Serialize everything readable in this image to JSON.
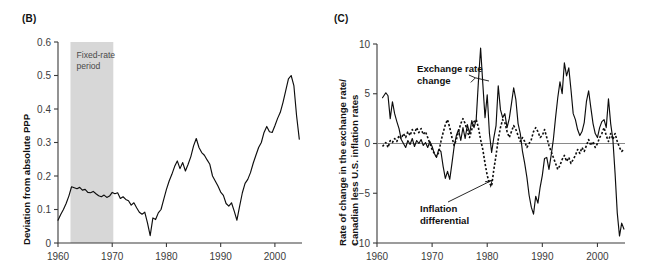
{
  "figure": {
    "panels": [
      {
        "id": "B",
        "label": "(B)",
        "shade_label_line1": "Fixed-rate",
        "shade_label_line2": "period"
      },
      {
        "id": "C",
        "label": "(C)",
        "annotation1_line1": "Exchange rate",
        "annotation1_line2": "change",
        "annotation2_line1": "Inflation",
        "annotation2_line2": "differential"
      }
    ]
  },
  "chart_data": [
    {
      "panel": "B",
      "type": "line",
      "title": "(B)",
      "xlabel": "",
      "ylabel": "Deviation from absolute PPP",
      "xlim": [
        1960,
        2005
      ],
      "ylim": [
        0,
        0.6
      ],
      "xticks": [
        1960,
        1970,
        1980,
        1990,
        2000
      ],
      "xtick_labels": [
        "1960",
        "1970",
        "1980",
        "1990",
        "2000"
      ],
      "yticks": [
        0,
        0.1,
        0.2,
        0.3,
        0.4,
        0.5,
        0.6
      ],
      "ytick_labels": [
        "0",
        "0.1",
        "0.2",
        "0.3",
        "0.4",
        "0.5",
        "0.6"
      ],
      "grid": false,
      "legend": "none",
      "annotations": [
        {
          "text": "Fixed-rate period",
          "type": "shaded-region-label",
          "x_range": [
            1962.3,
            1970.2
          ],
          "color": "#d7d7d7"
        }
      ],
      "series": [
        {
          "name": "Deviation from absolute PPP",
          "style": "solid",
          "x": [
            1960.0,
            1960.5,
            1961.0,
            1961.5,
            1962.0,
            1962.5,
            1963.0,
            1963.5,
            1964.0,
            1964.5,
            1965.0,
            1965.5,
            1966.0,
            1966.5,
            1967.0,
            1967.5,
            1968.0,
            1968.5,
            1969.0,
            1969.5,
            1970.0,
            1970.5,
            1971.0,
            1971.5,
            1972.0,
            1972.5,
            1973.0,
            1973.5,
            1974.0,
            1974.5,
            1975.0,
            1975.5,
            1976.0,
            1976.5,
            1977.0,
            1977.5,
            1978.0,
            1978.5,
            1979.0,
            1979.5,
            1980.0,
            1980.5,
            1981.0,
            1981.5,
            1982.0,
            1982.5,
            1983.0,
            1983.5,
            1984.0,
            1984.5,
            1985.0,
            1985.5,
            1986.0,
            1986.5,
            1987.0,
            1987.5,
            1988.0,
            1988.5,
            1989.0,
            1989.5,
            1990.0,
            1990.5,
            1991.0,
            1991.5,
            1992.0,
            1992.5,
            1993.0,
            1993.5,
            1994.0,
            1994.5,
            1995.0,
            1995.5,
            1996.0,
            1996.5,
            1997.0,
            1997.5,
            1998.0,
            1998.5,
            1999.0,
            1999.5,
            2000.0,
            2000.5,
            2001.0,
            2001.5,
            2002.0,
            2002.5,
            2003.0,
            2003.5,
            2004.0,
            2004.5
          ],
          "y": [
            0.068,
            0.085,
            0.1,
            0.118,
            0.14,
            0.168,
            0.165,
            0.162,
            0.166,
            0.158,
            0.16,
            0.151,
            0.15,
            0.154,
            0.147,
            0.141,
            0.138,
            0.143,
            0.136,
            0.14,
            0.151,
            0.147,
            0.15,
            0.133,
            0.138,
            0.13,
            0.126,
            0.113,
            0.12,
            0.105,
            0.092,
            0.086,
            0.092,
            0.06,
            0.022,
            0.075,
            0.07,
            0.09,
            0.1,
            0.13,
            0.16,
            0.185,
            0.205,
            0.228,
            0.245,
            0.222,
            0.24,
            0.215,
            0.235,
            0.258,
            0.29,
            0.312,
            0.285,
            0.27,
            0.262,
            0.248,
            0.235,
            0.2,
            0.185,
            0.17,
            0.152,
            0.142,
            0.118,
            0.11,
            0.12,
            0.095,
            0.068,
            0.11,
            0.15,
            0.178,
            0.19,
            0.21,
            0.238,
            0.262,
            0.285,
            0.3,
            0.33,
            0.348,
            0.332,
            0.33,
            0.35,
            0.372,
            0.39,
            0.42,
            0.455,
            0.49,
            0.5,
            0.47,
            0.38,
            0.31
          ],
          "units": "ratio"
        }
      ]
    },
    {
      "panel": "C",
      "type": "line",
      "title": "(C)",
      "xlabel": "",
      "ylabel": "Rate of change in the exchange rate/ Canadian less U.S. inflation rates",
      "ylabel_line1": "Rate of change in the exchange rate/",
      "ylabel_line2": "Canadian less U.S. inflation rates",
      "xlim": [
        1960,
        2005
      ],
      "ylim": [
        -10,
        10
      ],
      "xticks": [
        1960,
        1970,
        1980,
        1990,
        2000
      ],
      "xtick_labels": [
        "1960",
        "1970",
        "1980",
        "1990",
        "2000"
      ],
      "yticks": [
        -10,
        -5,
        0,
        5,
        10
      ],
      "ytick_labels": [
        "−10",
        "−5",
        "0",
        "5",
        "10"
      ],
      "grid": false,
      "legend": "annotations",
      "annotations": [
        {
          "text": "Exchange rate change",
          "points_to_series": "Exchange rate change",
          "at_x": 1978.5
        },
        {
          "text": "Inflation differential",
          "points_to_series": "Inflation differential",
          "at_x": 1980.5
        }
      ],
      "series": [
        {
          "name": "Exchange rate change",
          "style": "solid",
          "x": [
            1961.0,
            1961.6,
            1962.0,
            1962.4,
            1962.8,
            1963.2,
            1963.6,
            1964.0,
            1964.4,
            1964.8,
            1965.2,
            1965.6,
            1966.0,
            1966.4,
            1966.8,
            1967.2,
            1967.6,
            1968.0,
            1968.4,
            1968.8,
            1969.2,
            1969.6,
            1970.0,
            1970.4,
            1970.8,
            1971.2,
            1971.6,
            1972.0,
            1972.4,
            1972.8,
            1973.2,
            1973.6,
            1974.0,
            1974.4,
            1974.8,
            1975.2,
            1975.6,
            1976.0,
            1976.4,
            1976.8,
            1977.2,
            1977.6,
            1978.0,
            1978.4,
            1978.8,
            1979.2,
            1979.6,
            1980.0,
            1980.4,
            1980.8,
            1981.2,
            1981.6,
            1982.0,
            1982.4,
            1982.8,
            1983.2,
            1983.6,
            1984.0,
            1984.4,
            1984.8,
            1985.2,
            1985.6,
            1986.0,
            1986.4,
            1986.8,
            1987.2,
            1987.6,
            1988.0,
            1988.4,
            1988.8,
            1989.2,
            1989.6,
            1990.0,
            1990.4,
            1990.8,
            1991.2,
            1991.6,
            1992.0,
            1992.4,
            1992.8,
            1993.2,
            1993.6,
            1994.0,
            1994.4,
            1994.8,
            1995.2,
            1995.6,
            1996.0,
            1996.4,
            1996.8,
            1997.2,
            1997.6,
            1998.0,
            1998.4,
            1998.8,
            1999.2,
            1999.6,
            2000.0,
            2000.4,
            2000.8,
            2001.2,
            2001.6,
            2002.0,
            2002.4,
            2002.8,
            2003.2,
            2003.6,
            2004.0,
            2004.4,
            2004.8
          ],
          "y": [
            4.6,
            5.1,
            4.8,
            2.5,
            4.2,
            3.0,
            2.2,
            1.5,
            0.4,
            0.0,
            -0.4,
            0.3,
            -0.1,
            0.5,
            -0.3,
            0.3,
            0.0,
            0.4,
            -0.2,
            0.1,
            -0.4,
            0.2,
            -0.3,
            -1.0,
            -1.4,
            -0.6,
            -0.8,
            -2.3,
            -3.5,
            -2.8,
            -3.6,
            -2.0,
            -0.3,
            0.8,
            1.4,
            0.3,
            1.6,
            0.5,
            1.9,
            1.0,
            2.3,
            1.6,
            2.4,
            6.2,
            9.6,
            6.0,
            2.6,
            4.9,
            1.0,
            -0.9,
            0.6,
            1.8,
            5.8,
            3.4,
            2.6,
            3.0,
            1.6,
            2.5,
            4.0,
            5.6,
            4.4,
            2.0,
            1.0,
            -0.8,
            -2.0,
            -3.4,
            -5.2,
            -6.4,
            -7.1,
            -5.3,
            -6.0,
            -4.4,
            -3.2,
            -1.5,
            -1.4,
            -2.6,
            -1.2,
            0.4,
            2.6,
            4.6,
            6.2,
            5.0,
            8.1,
            6.8,
            7.6,
            5.4,
            3.0,
            2.4,
            1.4,
            0.8,
            1.2,
            2.1,
            4.2,
            5.3,
            3.6,
            2.0,
            1.0,
            0.6,
            1.6,
            2.2,
            2.4,
            1.6,
            4.5,
            2.0,
            0.4,
            -3.0,
            -7.0,
            -9.3,
            -8.0,
            -8.6
          ],
          "units": "percent"
        },
        {
          "name": "Inflation differential",
          "style": "dotted",
          "x": [
            1961.0,
            1961.6,
            1962.0,
            1962.4,
            1962.8,
            1963.2,
            1963.6,
            1964.0,
            1964.4,
            1964.8,
            1965.2,
            1965.6,
            1966.0,
            1966.4,
            1966.8,
            1967.2,
            1967.6,
            1968.0,
            1968.4,
            1968.8,
            1969.2,
            1969.6,
            1970.0,
            1970.4,
            1970.8,
            1971.2,
            1971.6,
            1972.0,
            1972.4,
            1972.8,
            1973.2,
            1973.6,
            1974.0,
            1974.4,
            1974.8,
            1975.2,
            1975.6,
            1976.0,
            1976.4,
            1976.8,
            1977.2,
            1977.6,
            1978.0,
            1978.4,
            1978.8,
            1979.2,
            1979.6,
            1980.0,
            1980.4,
            1980.8,
            1981.2,
            1981.6,
            1982.0,
            1982.4,
            1982.8,
            1983.2,
            1983.6,
            1984.0,
            1984.4,
            1984.8,
            1985.2,
            1985.6,
            1986.0,
            1986.4,
            1986.8,
            1987.2,
            1987.6,
            1988.0,
            1988.4,
            1988.8,
            1989.2,
            1989.6,
            1990.0,
            1990.4,
            1990.8,
            1991.2,
            1991.6,
            1992.0,
            1992.4,
            1992.8,
            1993.2,
            1993.6,
            1994.0,
            1994.4,
            1994.8,
            1995.2,
            1995.6,
            1996.0,
            1996.4,
            1996.8,
            1997.2,
            1997.6,
            1998.0,
            1998.4,
            1998.8,
            1999.2,
            1999.6,
            2000.0,
            2000.4,
            2000.8,
            2001.2,
            2001.6,
            2002.0,
            2002.4,
            2002.8,
            2003.2,
            2003.6,
            2004.0,
            2004.4,
            2004.8
          ],
          "y": [
            -0.3,
            0.1,
            -0.4,
            0.3,
            0.1,
            0.5,
            0.2,
            0.8,
            0.5,
            1.0,
            0.6,
            1.2,
            0.8,
            1.4,
            1.0,
            1.6,
            1.1,
            1.5,
            0.9,
            1.2,
            0.6,
            0.0,
            -0.6,
            -1.0,
            -1.3,
            -0.9,
            0.2,
            1.1,
            1.9,
            2.4,
            1.6,
            0.6,
            -0.2,
            0.4,
            1.2,
            2.0,
            2.5,
            2.0,
            1.2,
            0.6,
            1.4,
            2.2,
            2.4,
            1.6,
            0.4,
            -0.6,
            -2.0,
            -3.2,
            -4.0,
            -4.3,
            -2.6,
            -1.2,
            0.4,
            1.6,
            2.4,
            2.1,
            1.2,
            0.6,
            1.2,
            1.8,
            1.4,
            0.8,
            0.2,
            0.6,
            0.2,
            -0.4,
            0.0,
            0.4,
            1.2,
            1.6,
            1.2,
            0.6,
            0.8,
            1.4,
            0.6,
            -0.2,
            -0.8,
            -1.4,
            -2.0,
            -2.6,
            -2.2,
            -1.6,
            -1.2,
            -1.8,
            -1.4,
            -2.0,
            -1.6,
            -1.2,
            -0.6,
            -1.0,
            -0.4,
            -0.8,
            -0.2,
            0.4,
            -0.2,
            0.2,
            -0.4,
            0.0,
            0.6,
            1.0,
            1.6,
            0.8,
            0.2,
            1.0,
            0.4,
            1.0,
            0.2,
            -0.4,
            -0.8,
            -0.6
          ],
          "units": "percent"
        }
      ]
    }
  ]
}
